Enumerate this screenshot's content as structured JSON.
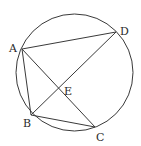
{
  "diagram": {
    "type": "circle-geometry",
    "points": {
      "A": {
        "label": "A",
        "on_circle": true
      },
      "B": {
        "label": "B",
        "on_circle": true
      },
      "C": {
        "label": "C",
        "on_circle": true
      },
      "D": {
        "label": "D",
        "on_circle": true
      },
      "E": {
        "label": "E",
        "on_circle": false,
        "intersection_of": [
          "AC",
          "BD"
        ]
      }
    },
    "segments": [
      {
        "from": "A",
        "to": "D"
      },
      {
        "from": "A",
        "to": "B"
      },
      {
        "from": "B",
        "to": "C"
      },
      {
        "from": "A",
        "to": "C"
      },
      {
        "from": "B",
        "to": "D"
      }
    ],
    "colors": {
      "stroke": "#3a3a3a",
      "label": "#2a2a2a",
      "background": "#ffffff"
    }
  }
}
